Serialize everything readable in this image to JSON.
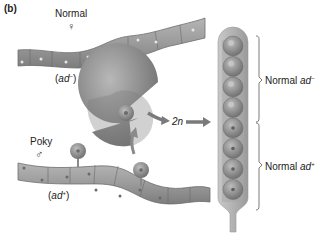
{
  "panel_label": "(b)",
  "top_strain": {
    "name": "Normal",
    "sex_symbol": "♀",
    "genotype_prefix": "(",
    "genotype_gene": "ad",
    "genotype_allele": "−",
    "genotype_suffix": ")"
  },
  "bottom_strain": {
    "name": "Poky",
    "sex_symbol": "♂",
    "genotype_prefix": "(",
    "genotype_gene": "ad",
    "genotype_allele": "+",
    "genotype_suffix": ")"
  },
  "process_label": "2n",
  "ascus": {
    "spore_count": 8,
    "groups": [
      {
        "label_prefix": "Normal ",
        "gene": "ad",
        "allele": "−",
        "spores": 4
      },
      {
        "label_prefix": "Normal ",
        "gene": "ad",
        "allele": "+",
        "spores": 4
      }
    ]
  },
  "colors": {
    "hypha": "#9a9a9a",
    "structure": "#8c8c8c",
    "arrow": "#7a7a7a",
    "text": "#222222"
  }
}
